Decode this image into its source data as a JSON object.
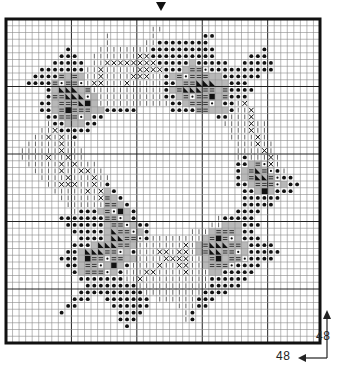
{
  "chart": {
    "columns": 48,
    "rows": 48,
    "major_grid_every": 10,
    "center_marker": "down-triangle",
    "colors": {
      "grid_minor": "#8a8a8a",
      "grid_major": "#222222",
      "border": "#111111",
      "symbol": "#111111",
      "grey_fill": "#b8b8b8",
      "background": "#ffffff"
    },
    "symbols": {
      "dot": "filled circle",
      "x": "cross",
      "bar": "vertical bar",
      "eq": "double dash",
      "sq": "filled square",
      "tri": "black triangle",
      "grey": "grey fill"
    },
    "motif_rows": [
      "................................................",
      "......................bb........................",
      "...............b......b.......dd................",
      "...............b.....bbdddddddd.................",
      ".........d....bbbbbbbbdddddddddd.......d........",
      "........ddd..bbbbbbbxxdddddddddd.....ddd........",
      ".......ddddd.bbxxxxxxxxdddddgddddd..ddddd.......",
      ".....dddddddbbxbbbbbxxxxdddgeeqdddddddddd.......",
      "....ddddegegbbxbbbbxxxbbdgeqeeeggdddddd.........",
      "...ddddeqeeqbxxbbbxbbbbbddgeetttggddd...........",
      "......dgtttgebbbbbbbbbbbdgettteegedddd..........",
      "......deetttqgbbbbbbbbbbddgeqeesgeddd...........",
      ".....ddgeeetsgbbbbbbbbbbbddgeeeqgddbx...........",
      ".....ddgeseeeggddddd.....ddddeegggdbbx..........",
      "......ddeeeqgdd.................ddbbbx..........",
      "......bddgggdd...................bbbbxbb........",
      ".....bbxddddd.....................bbbxbb........",
      "....bbxbxbd.......................bbbbxb........",
      "...bbbbbxbb........................bbbxbb.......",
      "..bbbbbbxbbb.......................bbbbxb.......",
      "..bbbbxbbxbb.......................bdbbbxb......",
      "...bbbbbxbxbbb.....................ddgeqxb......",
      "....bbbbxbbxxbb....................dgeteqdb.....",
      ".....bbbbxbbbxbb...................dgetteqdd....",
      "......bbxxxbbxbd...................ddgeeeqgdd...",
      ".......bbbbbxbxgd...................ddgsgddd....",
      "........bbbbbbxegd..................dddddd......",
      ".........bbbbbbeegd.................ddddd.......",
      "..........bdddgeqsgd...............dddd.........",
      "........dddddddeeqgd............bddddd..........",
      ".........ddddddgeeqgdd.........bbgggddd.........",
      "..........dddddgteeqgd......bbbgeeegdd..........",
      "...........ddddgtteeqdbbbbbbbbgeseqgddd.........",
      "..........dddgttteegbbbbbbbxbgettteegdddd.......",
      ".........ddgttteeqgdbbbxxbxxbgetteeqgddddd......",
      "........dddgseeqeeggbbbbxxxxbbgesgeeqdddd.......",
      ".........ddgeeqgsgdbbbbxbbxxbbgeeeqdddd.........",
      "..........dgeeeqgdbbbxxbbbbxbbbggddddd..........",
      "...........dddddddbbxbbbbbbbbbbdddddd...........",
      "............ddddddddbbbbbbbbbbbddddd............",
      "...........ddddddddddbbbbbbbbbdddd..............",
      "..........ddd..ddddddd.bbbbbbddd................",
      ".........dd.....dddddd....bbbdd.................",
      "........d........dddd......bd...................",
      ".................ddd.......bd...................",
      "..................d.............................",
      "................................................",
      "................................................"
    ]
  },
  "dimensions": {
    "height_label": "48",
    "width_label": "48"
  }
}
